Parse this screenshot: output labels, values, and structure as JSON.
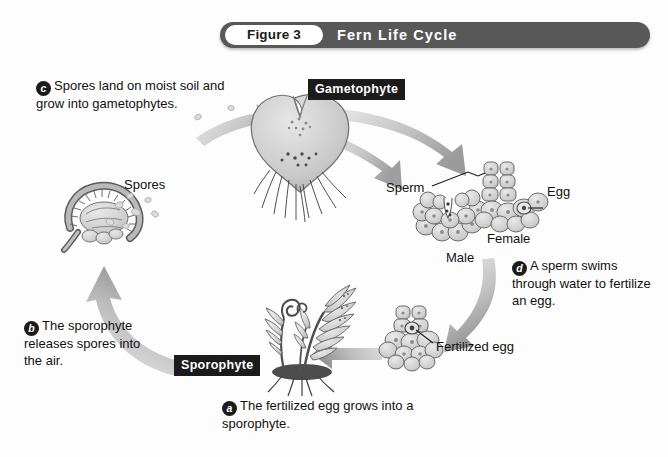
{
  "figure": {
    "number_label": "Figure 3",
    "title": "Fern Life Cycle"
  },
  "stage_chips": {
    "gametophyte": "Gametophyte",
    "sporophyte": "Sporophyte"
  },
  "callouts": [
    {
      "id": "a",
      "badge": "a",
      "text": "The fertilized egg grows into a sporophyte."
    },
    {
      "id": "b",
      "badge": "b",
      "text": "The sporophyte releases spores into the air."
    },
    {
      "id": "c",
      "badge": "c",
      "text": "Spores land on moist soil and grow into gametophytes."
    },
    {
      "id": "d",
      "badge": "d",
      "text": "A sperm swims through water to fertilize an egg."
    }
  ],
  "part_labels": {
    "spores": "Spores",
    "sperm": "Sperm",
    "egg": "Egg",
    "female": "Female",
    "male": "Male",
    "fertilized_egg": "Fertilized egg"
  },
  "icons": {
    "gametophyte_prothallus": "heart-shaped-gametophyte-icon",
    "sporangium": "sporangium-icon",
    "fern_plant": "fern-sporophyte-icon",
    "male_gametangium": "antheridium-icon",
    "female_gametangium": "archegonium-icon",
    "fertilized_egg_structure": "zygote-icon",
    "cycle_arrows": "curved-arrow-icon"
  },
  "colors": {
    "banner": "#585858",
    "chip": "#1b1b1b",
    "text": "#111111",
    "arrow_light": "#d8d8d8",
    "arrow_dark": "#9a9a9a",
    "artwork_fill": "#cfcfcf",
    "artwork_stroke": "#6e6e6e",
    "background": "#fdfdfd"
  }
}
